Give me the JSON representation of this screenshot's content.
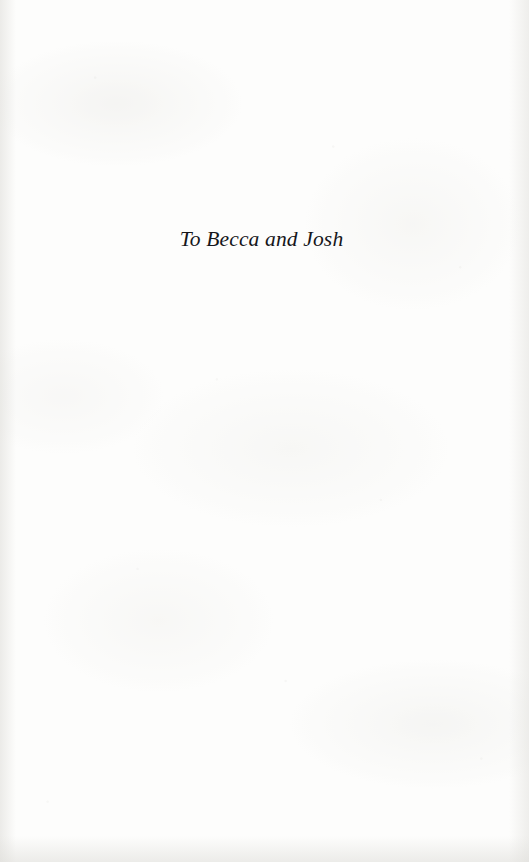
{
  "page": {
    "kind": "book-dedication-page",
    "background_color": "#fdfdfc",
    "ink_color": "#16161a"
  },
  "dedication": {
    "text": "To Becca and Josh"
  }
}
